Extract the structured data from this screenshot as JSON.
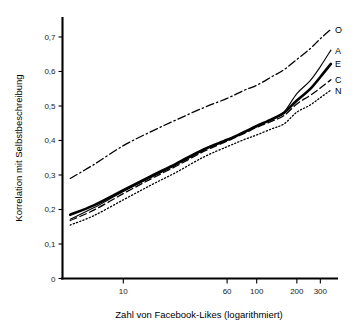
{
  "chart_data": {
    "type": "line",
    "title": "",
    "xlabel": "Zahl von Facebook-Likes (logarithmiert)",
    "ylabel": "Korrelation mit Selbstbeschreibung",
    "x_scale": "log",
    "x_ticks": [
      10,
      60,
      100,
      200,
      300
    ],
    "x_tick_labels": [
      "10",
      "60",
      "100",
      "200",
      "300"
    ],
    "xlim": [
      3.5,
      400
    ],
    "y_ticks": [
      0,
      0.1,
      0.2,
      0.3,
      0.4,
      0.5,
      0.6,
      0.7
    ],
    "y_tick_labels": [
      "0",
      "0,1",
      "0,2",
      "0,3",
      "0,4",
      "0,5",
      "0,6",
      "0,7"
    ],
    "ylim": [
      0,
      0.755
    ],
    "grid": false,
    "legend_position": "right-inline-labels",
    "decimal_separator": ",",
    "x": [
      4,
      6,
      10,
      16,
      25,
      40,
      60,
      80,
      100,
      130,
      160,
      200,
      250,
      300,
      360
    ],
    "series": [
      {
        "name": "O",
        "label": "O",
        "linestyle": "dashdot",
        "linewidth": 1.3,
        "color": "#000000",
        "values": [
          0.29,
          0.33,
          0.385,
          0.425,
          0.46,
          0.495,
          0.522,
          0.545,
          0.56,
          0.585,
          0.605,
          0.635,
          0.665,
          0.695,
          0.722
        ]
      },
      {
        "name": "A",
        "label": "A",
        "linestyle": "solid-thin",
        "linewidth": 1.1,
        "color": "#000000",
        "values": [
          0.172,
          0.205,
          0.252,
          0.292,
          0.33,
          0.372,
          0.4,
          0.422,
          0.44,
          0.462,
          0.482,
          0.536,
          0.572,
          0.614,
          0.662
        ]
      },
      {
        "name": "E",
        "label": "E",
        "linestyle": "solid-thick",
        "linewidth": 2.6,
        "color": "#000000",
        "values": [
          0.185,
          0.212,
          0.256,
          0.296,
          0.333,
          0.374,
          0.402,
          0.424,
          0.442,
          0.462,
          0.48,
          0.516,
          0.548,
          0.584,
          0.622
        ]
      },
      {
        "name": "C",
        "label": "C",
        "linestyle": "dashed",
        "linewidth": 1.3,
        "color": "#000000",
        "values": [
          0.168,
          0.198,
          0.246,
          0.288,
          0.326,
          0.368,
          0.398,
          0.42,
          0.438,
          0.456,
          0.472,
          0.506,
          0.53,
          0.552,
          0.576
        ]
      },
      {
        "name": "N",
        "label": "N",
        "linestyle": "dotted",
        "linewidth": 1.3,
        "color": "#000000",
        "values": [
          0.155,
          0.182,
          0.228,
          0.27,
          0.308,
          0.352,
          0.382,
          0.402,
          0.416,
          0.434,
          0.448,
          0.482,
          0.502,
          0.524,
          0.546
        ]
      }
    ]
  },
  "axes": {
    "x_title": "Zahl von Facebook-Likes (logarithmiert)",
    "y_title": "Korrelation mit Selbstbeschreibung"
  }
}
